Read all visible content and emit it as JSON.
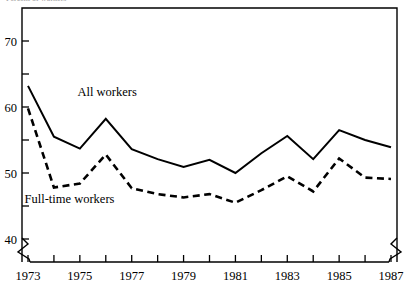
{
  "figure": {
    "cutoff_top_text": "Percent of workers",
    "background_color": "#ffffff",
    "ink_color": "#000000"
  },
  "chart_data": {
    "type": "line",
    "title": "",
    "xlabel": "",
    "ylabel": "",
    "xlim": [
      1973,
      1987
    ],
    "ylim": [
      36.5,
      73.5
    ],
    "grid": false,
    "legend_position": "inline-annotation",
    "axis_break": {
      "x_axis_left": true,
      "x_axis_right": true
    },
    "x": [
      1973,
      1974,
      1975,
      1976,
      1977,
      1978,
      1979,
      1980,
      1981,
      1982,
      1983,
      1984,
      1985,
      1986,
      1987
    ],
    "xticks": [
      1973,
      1974,
      1975,
      1976,
      1977,
      1978,
      1979,
      1980,
      1981,
      1982,
      1983,
      1984,
      1985,
      1986,
      1987
    ],
    "xticklabels": [
      "1973",
      "",
      "1975",
      "",
      "1977",
      "",
      "1979",
      "",
      "1981",
      "",
      "1983",
      "",
      "1985",
      "",
      "1987"
    ],
    "yticks": [
      40,
      45,
      50,
      55,
      60,
      65,
      70
    ],
    "yticklabels": [
      "40",
      "",
      "50",
      "",
      "60",
      "",
      "70"
    ],
    "ytick_major_labels": [
      "70",
      "60",
      "50",
      "40"
    ],
    "series": [
      {
        "name": "All workers",
        "style": "solid",
        "color": "#000000",
        "label_x": 1976.05,
        "label_y": 61.6,
        "values": [
          63.2,
          55.5,
          53.7,
          58.2,
          53.6,
          52.1,
          50.9,
          52.0,
          50.0,
          53.0,
          55.6,
          52.1,
          56.5,
          55.0,
          53.9
        ]
      },
      {
        "name": "Full-time workers",
        "style": "dashed",
        "color": "#000000",
        "label_x": 1974.6,
        "label_y": 45.5,
        "values": [
          59.8,
          47.8,
          48.4,
          52.8,
          47.7,
          46.8,
          46.3,
          46.8,
          45.5,
          47.4,
          49.5,
          47.2,
          52.2,
          49.3,
          49.1
        ]
      }
    ]
  }
}
